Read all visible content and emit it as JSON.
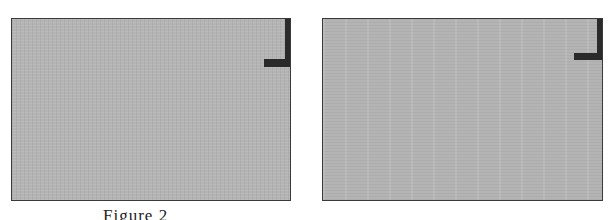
{
  "figure": {
    "caption": "Figure 2",
    "panels": [
      {
        "id": "left",
        "fill_color": "#b4b4b4",
        "border_color": "#3a3a3a",
        "marker": "top-right-corner-bracket"
      },
      {
        "id": "right",
        "fill_color": "#b4b4b4",
        "border_color": "#3a3a3a",
        "marker": "top-right-corner-bracket"
      }
    ]
  }
}
